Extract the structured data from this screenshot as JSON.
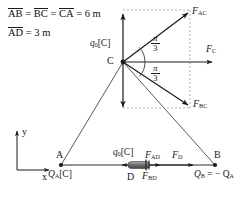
{
  "figure": {
    "type": "physics-free-body-diagram",
    "colors": {
      "stroke": "#1a1a1a",
      "background": "#ffffff",
      "dashed_guide": "#9a9a9a",
      "dipole_fill": "#7d7d7d"
    }
  },
  "given": {
    "line1": {
      "seg1": "AB",
      "eq1": " = ",
      "seg2": "BC",
      "eq2": " = ",
      "seg3": "CA",
      "value": " = 6 m"
    },
    "line2": {
      "seg1": "AD",
      "value": " = 3 m"
    }
  },
  "vertices": {
    "A": {
      "label": "A",
      "charge": "Q",
      "charge_sub": "A",
      "charge_unit": "[C]"
    },
    "B": {
      "label": "B",
      "charge_expr_lhs": "Q",
      "charge_lhs_sub": "B",
      "charge_expr_rhs": " = − Q",
      "charge_rhs_sub": "A"
    },
    "C": {
      "label": "C",
      "charge": "q",
      "charge_sub": "0",
      "charge_unit": "[C]"
    },
    "D": {
      "label": "D",
      "charge": "q",
      "charge_sub": "0",
      "charge_unit": "[C]"
    }
  },
  "forces": {
    "F_AC": {
      "symbol": "F",
      "sub": "AC"
    },
    "F_BC": {
      "symbol": "F",
      "sub": "BC"
    },
    "F_C": {
      "symbol": "F",
      "sub": "C"
    },
    "F_AD": {
      "symbol": "F",
      "sub": "AD"
    },
    "F_BD": {
      "symbol": "F",
      "sub": "BD"
    },
    "F_D": {
      "symbol": "F",
      "sub": "D"
    }
  },
  "angles": {
    "upper": {
      "numerator": "π",
      "denominator": "3"
    },
    "lower": {
      "numerator": "π",
      "denominator": "3"
    }
  },
  "axes": {
    "x_label": "x",
    "y_label": "y"
  }
}
